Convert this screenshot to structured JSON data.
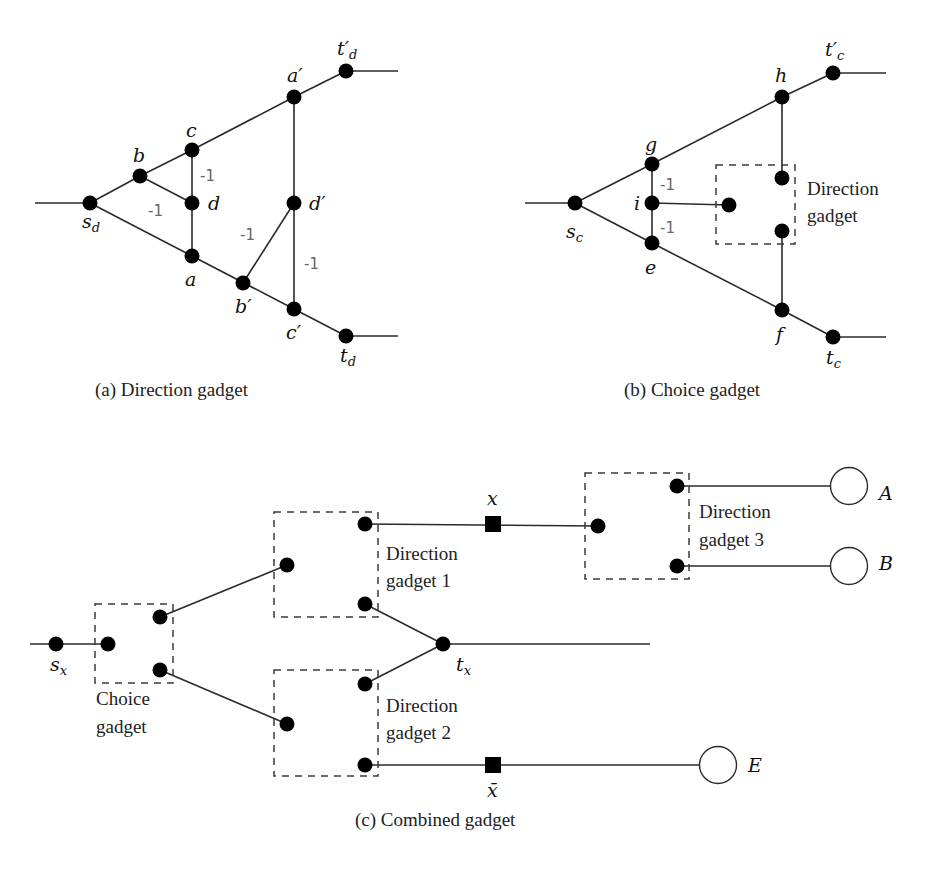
{
  "figure": {
    "panels": [
      {
        "id": "a",
        "caption": "(a) Direction gadget",
        "nodes": [
          {
            "id": "s_d",
            "label": "s",
            "sub": "d"
          },
          {
            "id": "b",
            "label": "b"
          },
          {
            "id": "c",
            "label": "c"
          },
          {
            "id": "d",
            "label": "d"
          },
          {
            "id": "a",
            "label": "a"
          },
          {
            "id": "b'",
            "label": "b′"
          },
          {
            "id": "c'",
            "label": "c′"
          },
          {
            "id": "d'",
            "label": "d′"
          },
          {
            "id": "a'",
            "label": "a′"
          },
          {
            "id": "t'_d",
            "label": "t′",
            "sub": "d"
          },
          {
            "id": "t_d",
            "label": "t",
            "sub": "d"
          }
        ],
        "edges": [
          [
            "in",
            "s_d"
          ],
          [
            "s_d",
            "b"
          ],
          [
            "b",
            "c"
          ],
          [
            "b",
            "d"
          ],
          [
            "c",
            "d"
          ],
          [
            "d",
            "a"
          ],
          [
            "s_d",
            "a"
          ],
          [
            "a",
            "b'"
          ],
          [
            "b'",
            "c'"
          ],
          [
            "b'",
            "d'"
          ],
          [
            "d'",
            "c'"
          ],
          [
            "a'",
            "d'"
          ],
          [
            "c",
            "a'"
          ],
          [
            "a'",
            "t'_d"
          ],
          [
            "c'",
            "t_d"
          ],
          [
            "t'_d",
            "out"
          ],
          [
            "t_d",
            "out"
          ]
        ],
        "weights": [
          {
            "edge": [
              "c",
              "d"
            ],
            "value": "-1"
          },
          {
            "edge": [
              "b",
              "d"
            ],
            "value": "-1"
          },
          {
            "edge": [
              "b'",
              "d'"
            ],
            "value": "-1"
          },
          {
            "edge": [
              "d'",
              "c'"
            ],
            "value": "-1"
          }
        ]
      },
      {
        "id": "b",
        "caption": "(b) Choice gadget",
        "nodes": [
          {
            "id": "s_c",
            "label": "s",
            "sub": "c"
          },
          {
            "id": "g",
            "label": "g"
          },
          {
            "id": "i",
            "label": "i"
          },
          {
            "id": "e",
            "label": "e"
          },
          {
            "id": "h",
            "label": "h"
          },
          {
            "id": "f",
            "label": "f"
          },
          {
            "id": "t'_c",
            "label": "t′",
            "sub": "c"
          },
          {
            "id": "t_c",
            "label": "t",
            "sub": "c"
          }
        ],
        "box_label_line1": "Direction",
        "box_label_line2": "gadget",
        "weights": [
          {
            "edge": [
              "g",
              "i"
            ],
            "value": "-1"
          },
          {
            "edge": [
              "i",
              "e"
            ],
            "value": "-1"
          }
        ]
      },
      {
        "id": "c",
        "caption": "(c) Combined gadget",
        "nodes": [
          {
            "id": "s_x",
            "label": "s",
            "sub": "x"
          },
          {
            "id": "t_x",
            "label": "t",
            "sub": "x"
          },
          {
            "id": "x",
            "label": "x",
            "shape": "square"
          },
          {
            "id": "xbar",
            "label": "x̄",
            "shape": "square"
          },
          {
            "id": "A",
            "label": "A",
            "shape": "open-circle"
          },
          {
            "id": "B",
            "label": "B",
            "shape": "open-circle"
          },
          {
            "id": "E",
            "label": "E",
            "shape": "open-circle"
          }
        ],
        "boxes": [
          {
            "id": "choice",
            "line1": "Choice",
            "line2": "gadget"
          },
          {
            "id": "dir1",
            "line1": "Direction",
            "line2": "gadget 1"
          },
          {
            "id": "dir2",
            "line1": "Direction",
            "line2": "gadget 2"
          },
          {
            "id": "dir3",
            "line1": "Direction",
            "line2": "gadget 3"
          }
        ]
      }
    ]
  }
}
